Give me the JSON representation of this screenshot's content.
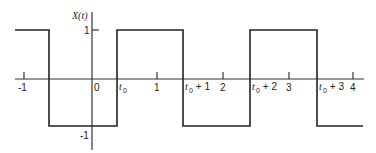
{
  "figure": {
    "type": "square-wave-plot",
    "y_axis_label": "X(t)",
    "y_ticks": [
      {
        "value": 1,
        "label": "1"
      },
      {
        "value": -1,
        "label": "-1"
      }
    ],
    "x_ticks": [
      {
        "value": -1,
        "label": "-1"
      },
      {
        "value": 0,
        "label": "0"
      },
      {
        "value": 1,
        "label": "1"
      },
      {
        "value": 2,
        "label": "2"
      },
      {
        "value": 3,
        "label": "3"
      },
      {
        "value": 4,
        "label": "4"
      }
    ],
    "transition_labels": [
      {
        "label": "t",
        "sub": "0",
        "suffix": ""
      },
      {
        "label": "t",
        "sub": "0",
        "suffix": " + 1"
      },
      {
        "label": "t",
        "sub": "0",
        "suffix": " + 2"
      },
      {
        "label": "t",
        "sub": "0",
        "suffix": " + 3"
      }
    ],
    "signal": {
      "high": 1,
      "low": -1,
      "period": 2,
      "segments": [
        {
          "from": "-1.15",
          "to": "t0-1",
          "level": 1
        },
        {
          "from": "t0-1",
          "to": "t0",
          "level": -1
        },
        {
          "from": "t0",
          "to": "t0+1",
          "level": 1
        },
        {
          "from": "t0+1",
          "to": "t0+2",
          "level": -1
        },
        {
          "from": "t0+2",
          "to": "t0+3",
          "level": 1
        },
        {
          "from": "t0+3",
          "to": "4.15",
          "level": -1
        }
      ]
    },
    "colors": {
      "line": "#222222",
      "axis": "#333333",
      "background": "#ffffff"
    }
  }
}
